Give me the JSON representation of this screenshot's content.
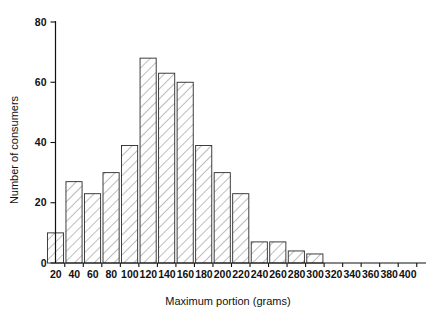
{
  "chart_data": {
    "type": "bar",
    "title": "",
    "subtitle": "",
    "xlabel": "Maximum portion (grams)",
    "ylabel": "Number of consumers",
    "categories": [
      "20",
      "40",
      "60",
      "80",
      "100",
      "120",
      "140",
      "160",
      "180",
      "200",
      "220",
      "240",
      "260",
      "280",
      "300",
      "320",
      "340",
      "360",
      "380",
      "400"
    ],
    "bin_centers": [
      20,
      40,
      60,
      80,
      100,
      120,
      140,
      160,
      180,
      200,
      220,
      240,
      260,
      280,
      300,
      320,
      340,
      360,
      380,
      400
    ],
    "bin_width": 20,
    "values": [
      10,
      27,
      23,
      30,
      39,
      68,
      63,
      60,
      39,
      30,
      23,
      7,
      7,
      4,
      3,
      0,
      0,
      0,
      0,
      0
    ],
    "xlim": [
      10,
      410
    ],
    "ylim": [
      0,
      80
    ],
    "x_ticks": [
      20,
      40,
      60,
      80,
      100,
      120,
      140,
      160,
      180,
      200,
      220,
      240,
      260,
      280,
      300,
      320,
      340,
      360,
      380,
      400
    ],
    "x_tick_labels": [
      "20",
      "40",
      "60",
      "80",
      "100",
      "120",
      "140",
      "160",
      "180",
      "200",
      "220",
      "240",
      "260",
      "280",
      "300",
      "320",
      "340",
      "360",
      "380",
      "400"
    ],
    "y_ticks": [
      0,
      20,
      40,
      60,
      80
    ],
    "y_tick_labels": [
      "0",
      "20",
      "40",
      "60",
      "80"
    ],
    "grid": false,
    "legend": null,
    "bar_fill": "hatched-diagonal",
    "colors": {
      "axis": "#111111",
      "bar_edge": "#2a2a2a",
      "bar_hatch": "#555555",
      "background": "#ffffff"
    }
  }
}
